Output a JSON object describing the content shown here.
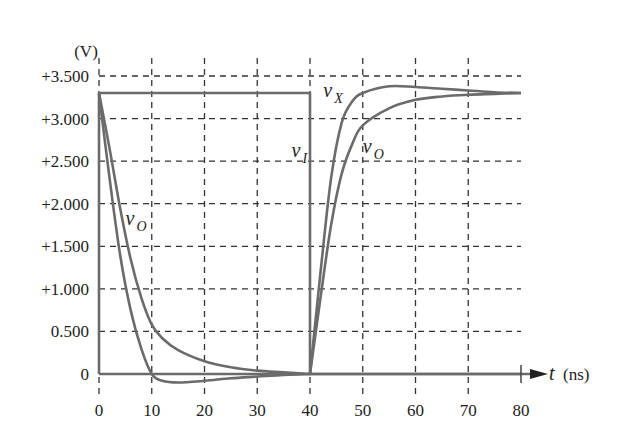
{
  "chart_data": {
    "type": "line",
    "title": "",
    "xlabel": "t (ns)",
    "ylabel": "(V)",
    "x_ticks": [
      0,
      10,
      20,
      30,
      40,
      50,
      60,
      70,
      80
    ],
    "y_ticks": [
      0,
      0.5,
      1.0,
      1.5,
      2.0,
      2.5,
      3.0,
      3.5
    ],
    "y_tick_labels": [
      "0",
      "0.500",
      "+1.000",
      "+1.500",
      "+2.000",
      "+2.500",
      "+3.000",
      "+3.500"
    ],
    "xlim": [
      0,
      80
    ],
    "ylim": [
      -0.15,
      3.5
    ],
    "grid": true,
    "legend": "none (inline curve labels)",
    "series": [
      {
        "name": "v_I",
        "label_main": "v",
        "label_sub": "I",
        "x": [
          0,
          0,
          40,
          40,
          80
        ],
        "y": [
          0,
          3.3,
          3.3,
          0,
          0
        ]
      },
      {
        "name": "v_X",
        "label_main": "v",
        "label_sub": "X",
        "x": [
          0,
          2,
          4,
          6,
          8,
          10,
          12,
          15,
          20,
          25,
          30,
          35,
          40,
          42,
          44,
          46,
          48,
          50,
          55,
          60,
          65,
          70,
          75,
          80
        ],
        "y": [
          3.3,
          2.3,
          1.4,
          0.75,
          0.3,
          0.0,
          -0.08,
          -0.1,
          -0.08,
          -0.05,
          -0.03,
          -0.01,
          0,
          1.2,
          2.3,
          2.95,
          3.2,
          3.3,
          3.38,
          3.37,
          3.35,
          3.33,
          3.31,
          3.3
        ]
      },
      {
        "name": "v_O",
        "label_main": "v",
        "label_sub": "O",
        "x": [
          0,
          2,
          4,
          6,
          8,
          10,
          12,
          15,
          20,
          25,
          30,
          35,
          40,
          42,
          44,
          46,
          48,
          50,
          55,
          60,
          65,
          70,
          75,
          80
        ],
        "y": [
          3.3,
          2.65,
          1.95,
          1.35,
          0.9,
          0.58,
          0.42,
          0.28,
          0.15,
          0.08,
          0.04,
          0.02,
          0,
          0.9,
          1.75,
          2.35,
          2.7,
          2.92,
          3.12,
          3.22,
          3.26,
          3.28,
          3.29,
          3.3
        ]
      }
    ],
    "annotations": [
      {
        "text_main": "v",
        "text_sub": "O",
        "x": 5,
        "y": 1.75,
        "refers_to": "v_O falling"
      },
      {
        "text_main": "v",
        "text_sub": "I",
        "x": 36.5,
        "y": 2.55,
        "refers_to": "v_I"
      },
      {
        "text_main": "v",
        "text_sub": "X",
        "x": 42.5,
        "y": 3.25,
        "refers_to": "v_X"
      },
      {
        "text_main": "v",
        "text_sub": "O",
        "x": 50,
        "y": 2.6,
        "refers_to": "v_O rising"
      }
    ],
    "colors": {
      "curve": "#6b6b6b",
      "grid": "#333333",
      "text": "#222222"
    }
  },
  "axes": {
    "y_unit": "(V)",
    "x_unit_var": "t",
    "x_unit": "(ns)"
  }
}
